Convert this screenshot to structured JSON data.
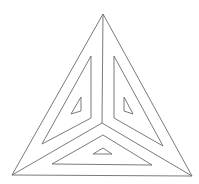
{
  "figure": {
    "stroke_color": "#6b6b6b",
    "background": "#ffffff",
    "outer_triangle": [
      [
        103,
        14
      ],
      [
        12,
        175
      ],
      [
        192,
        176
      ]
    ],
    "center": [
      102,
      123
    ],
    "inner_triangles": [
      {
        "name": "left",
        "points": [
          [
            91,
            56
          ],
          [
            42,
            144
          ],
          [
            91,
            118
          ]
        ],
        "small": [
          [
            81,
            97
          ],
          [
            71,
            114
          ],
          [
            81,
            111
          ]
        ]
      },
      {
        "name": "right",
        "points": [
          [
            114,
            56
          ],
          [
            114,
            118
          ],
          [
            163,
            146
          ]
        ],
        "small": [
          [
            124,
            97
          ],
          [
            124,
            111
          ],
          [
            133,
            114
          ]
        ]
      },
      {
        "name": "bottom",
        "points": [
          [
            103,
            135
          ],
          [
            52,
            164
          ],
          [
            152,
            165
          ]
        ],
        "small": [
          [
            103,
            148
          ],
          [
            93,
            154
          ],
          [
            112,
            154
          ]
        ]
      }
    ]
  }
}
